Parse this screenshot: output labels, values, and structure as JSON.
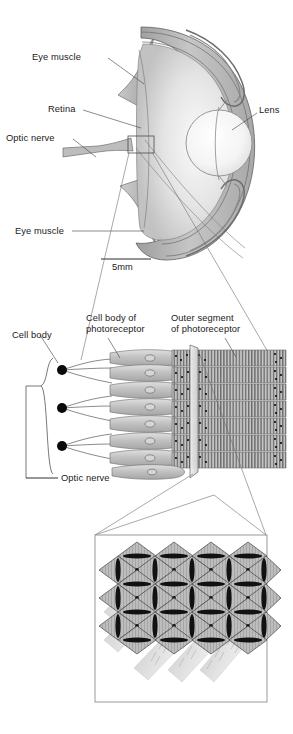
{
  "figure": {
    "scale_bar": {
      "label": "5mm",
      "length_px": 50
    },
    "panels": [
      {
        "name": "whole-eye-cross-section",
        "order": 1
      },
      {
        "name": "photoreceptor-array",
        "order": 2
      },
      {
        "name": "ommatidia-cross-section-detail",
        "order": 3
      }
    ]
  },
  "labels": {
    "eye_muscle_top": "Eye muscle",
    "retina": "Retina",
    "optic_nerve_top": "Optic nerve",
    "lens": "Lens",
    "eye_muscle_bottom": "Eye muscle",
    "scale": "5mm",
    "cell_body": "Cell body",
    "cell_body_of_photoreceptor_l1": "Cell body of",
    "cell_body_of_photoreceptor_l2": "photoreceptor",
    "outer_segment_l1": "Outer segment",
    "outer_segment_l2": "of photoreceptor",
    "optic_nerve_bottom": "Optic nerve"
  },
  "colors": {
    "ink": "#1a1a1a",
    "leader_line": "#4d4d4d",
    "outline": "#5a5a5a",
    "sclera_fill": "#b9b9b9",
    "vitreous_light": "#f2f2f2",
    "vitreous_mid": "#d2d2d2",
    "lens_fill": "#fbfbfb",
    "lens_edge": "#8a8a8a",
    "cell_fill": "#c9c9c9",
    "cell_edge": "#6b6b6b",
    "segment_fill": "#c4c4c4",
    "segment_stripe": "#5e5e5e",
    "nucleus_black": "#0a0a0a",
    "detail_box_edge": "#8f8f8f",
    "rhabdom_black": "#111111"
  },
  "structure": {
    "ganglion_cell_count": 3,
    "photoreceptor_row_count": 9,
    "outer_segment_row_count": 5,
    "ommatidia_grid": {
      "rows": 5,
      "cols": 5,
      "shape": "diamond"
    }
  }
}
